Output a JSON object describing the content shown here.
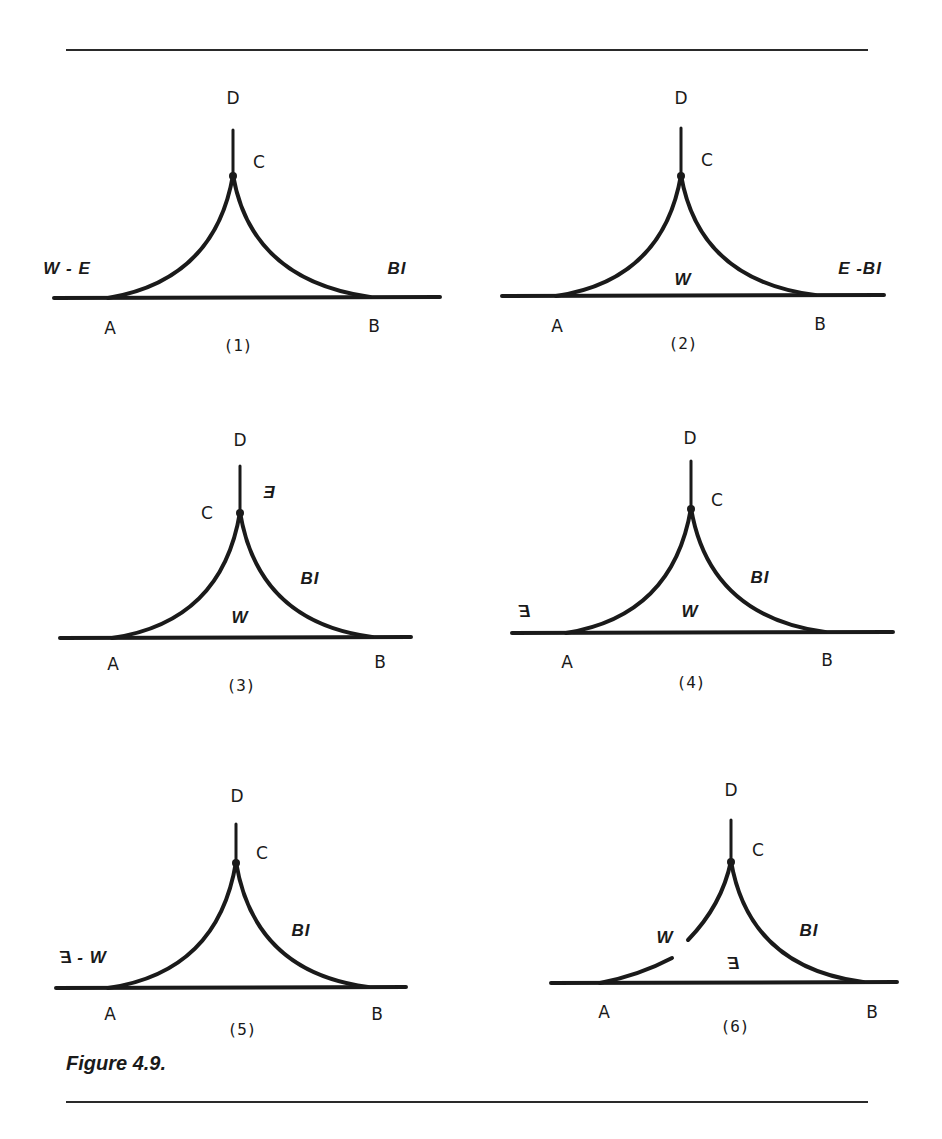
{
  "figure": {
    "caption": "Figure 4.9.",
    "stroke_color": "#1a1a1a",
    "background": "#ffffff"
  },
  "panels": [
    {
      "id": "(1)",
      "points": {
        "A": "A",
        "B": "B",
        "C": "C",
        "D": "D"
      },
      "phase_labels": {
        "left": "W - E",
        "right": "BI"
      }
    },
    {
      "id": "(2)",
      "points": {
        "A": "A",
        "B": "B",
        "C": "C",
        "D": "D"
      },
      "phase_labels": {
        "inside": "W",
        "right": "E -BI"
      }
    },
    {
      "id": "(3)",
      "points": {
        "A": "A",
        "B": "B",
        "C": "C",
        "D": "D"
      },
      "phase_labels": {
        "stem": "E",
        "arc_right": "BI",
        "inside": "W"
      }
    },
    {
      "id": "(4)",
      "points": {
        "A": "A",
        "B": "B",
        "C": "C",
        "D": "D"
      },
      "phase_labels": {
        "left": "E",
        "arc_right": "BI",
        "inside": "W"
      }
    },
    {
      "id": "(5)",
      "points": {
        "A": "A",
        "B": "B",
        "C": "C",
        "D": "D"
      },
      "phase_labels": {
        "left_a": "E",
        "left_sep": "-",
        "left_b": "W",
        "arc_right": "BI"
      }
    },
    {
      "id": "(6)",
      "points": {
        "A": "A",
        "B": "B",
        "C": "C",
        "D": "D"
      },
      "phase_labels": {
        "arc_left": "W",
        "inside": "E",
        "arc_right": "BI"
      }
    }
  ]
}
